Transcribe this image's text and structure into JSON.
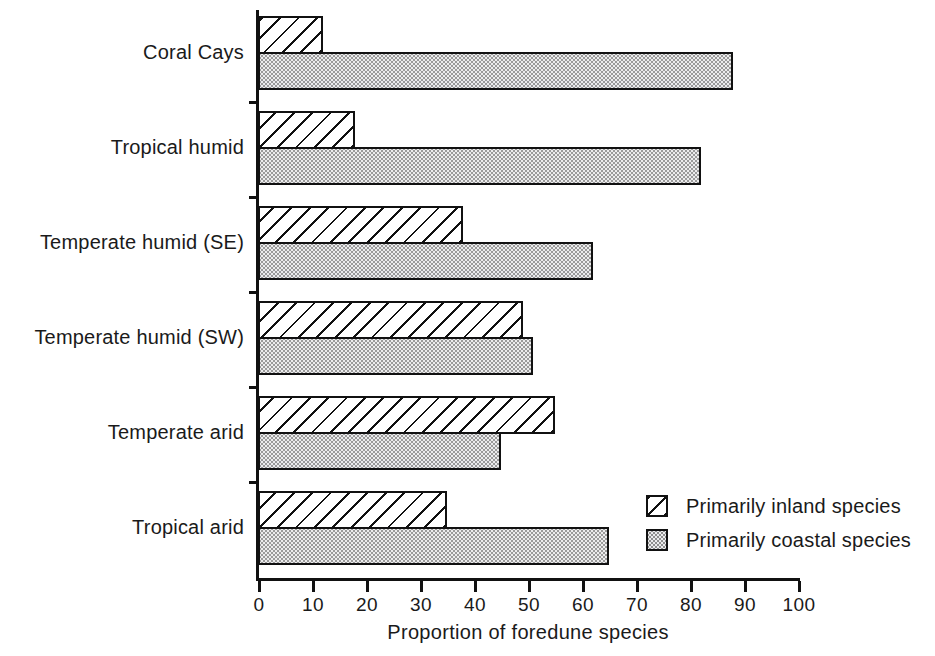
{
  "chart_data": {
    "type": "bar",
    "orientation": "horizontal",
    "title": "",
    "xlabel": "Proportion of foredune species",
    "ylabel": "",
    "xlim": [
      0,
      100
    ],
    "xticks": [
      0,
      10,
      20,
      30,
      40,
      50,
      60,
      70,
      80,
      90,
      100
    ],
    "xtick_labels": [
      "0",
      "10",
      "20",
      "30",
      "40",
      "50",
      "60",
      "70",
      "80",
      "90",
      "100"
    ],
    "grid": false,
    "legend_position": "inside-lower-right",
    "categories": [
      "Coral Cays",
      "Tropical humid",
      "Temperate humid (SE)",
      "Temperate humid (SW)",
      "Temperate arid",
      "Tropical arid"
    ],
    "series": [
      {
        "name": "Primarily inland species",
        "fill": "hatched",
        "values": [
          12,
          18,
          38,
          49,
          55,
          35
        ]
      },
      {
        "name": "Primarily coastal species",
        "fill": "stippled",
        "values": [
          88,
          82,
          62,
          51,
          45,
          65
        ]
      }
    ],
    "colors": {
      "axis": "#111111",
      "inland_fill": "#ffffff",
      "inland_hatch": "#111111",
      "coastal_fill": "#ececed",
      "coastal_stipple": "#9a9a9a"
    }
  },
  "legend": {
    "items": [
      {
        "label": "Primarily inland species",
        "swatch": "hatched-square-icon"
      },
      {
        "label": "Primarily coastal species",
        "swatch": "stippled-square-icon"
      }
    ]
  }
}
